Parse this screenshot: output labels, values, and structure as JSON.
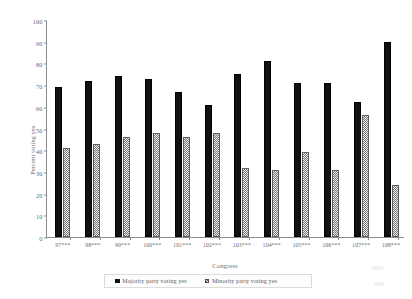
{
  "chart_data": {
    "type": "bar",
    "title": "",
    "xlabel": "Congress",
    "ylabel": "Percent voting yes",
    "ylim": [
      0,
      100
    ],
    "yticks": [
      0,
      10,
      20,
      30,
      40,
      50,
      60,
      70,
      80,
      90,
      100
    ],
    "grid": false,
    "legend_position": "bottom",
    "categories": [
      "97***",
      "98***",
      "99***",
      "100***",
      "101***",
      "102***",
      "103***",
      "104***",
      "105***",
      "106***",
      "107***",
      "108***"
    ],
    "series": [
      {
        "name": "Majority party voting yes",
        "color": "#111112",
        "pattern": "solid",
        "values": [
          69,
          72,
          74,
          73,
          67,
          61,
          75,
          81,
          71,
          71,
          62,
          90
        ]
      },
      {
        "name": "Minority party voting yes",
        "color": "#e9e9e9",
        "pattern": "checkerboard",
        "values": [
          41,
          43,
          46,
          48,
          46,
          48,
          32,
          31,
          39,
          31,
          56,
          24
        ]
      }
    ]
  },
  "axes": {
    "y_title": "Percent voting yes",
    "x_title": "Congress",
    "y_tick_labels": [
      "0",
      "10",
      "20",
      "30",
      "40",
      "50",
      "60",
      "70",
      "80",
      "90",
      "100"
    ],
    "x_tick_labels": [
      "97***",
      "98***",
      "99***",
      "100***",
      "101***",
      "102***",
      "103***",
      "104***",
      "105***",
      "106***",
      "107***",
      "108***"
    ]
  },
  "legend": {
    "entries": [
      {
        "label": "Majority party voting yes",
        "swatch": "solid-black-square-icon"
      },
      {
        "label": "Minority party voting yes",
        "swatch": "checkered-square-icon"
      }
    ]
  }
}
